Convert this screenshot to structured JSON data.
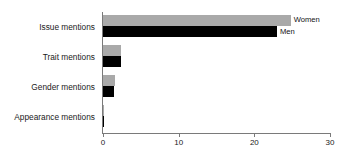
{
  "chart_data": {
    "type": "bar",
    "orientation": "horizontal",
    "title": "",
    "subtitle": "",
    "xlabel": "",
    "ylabel": "",
    "categories": [
      "Issue mentions",
      "Trait mentions",
      "Gender mentions",
      "Appearance mentions"
    ],
    "series": [
      {
        "name": "Women",
        "color": "#a9a9a9",
        "values": [
          24.8,
          2.4,
          1.6,
          0.1
        ]
      },
      {
        "name": "Men",
        "color": "#000000",
        "values": [
          23.0,
          2.4,
          1.5,
          0.1
        ]
      }
    ],
    "xlim": [
      0,
      30
    ],
    "xticks": [
      0,
      10,
      20,
      30
    ],
    "xtick_labels": [
      "0",
      "10",
      "20",
      "30"
    ],
    "grid": false,
    "legend": "inline-right-of-bars",
    "legend_entries": [
      "Women",
      "Men"
    ]
  },
  "axis": {
    "tick_0": "0",
    "tick_10": "10",
    "tick_20": "20",
    "tick_30": "30"
  },
  "categories": {
    "issue": "Issue mentions",
    "trait": "Trait mentions",
    "gender": "Gender mentions",
    "appearance": "Appearance mentions"
  },
  "legend": {
    "women": "Women",
    "men": "Men"
  },
  "colors": {
    "women_bar": "#a9a9a9",
    "men_bar": "#000000",
    "axis": "#7a7a7a",
    "background": "#ffffff"
  }
}
